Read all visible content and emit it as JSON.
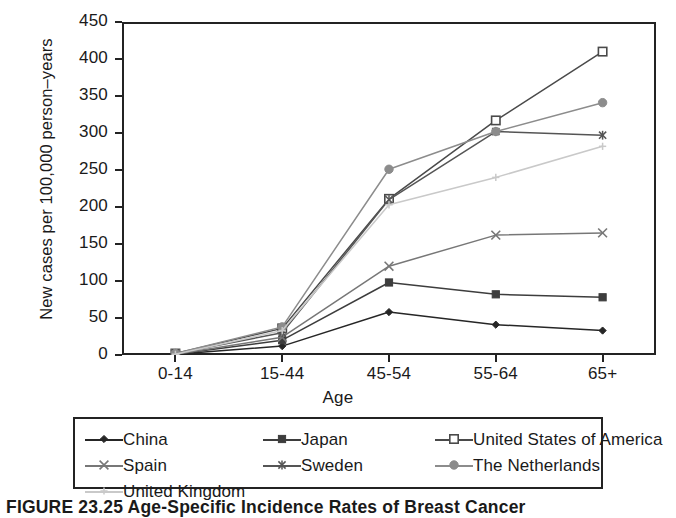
{
  "chart_data": {
    "type": "line",
    "title": "",
    "xlabel": "Age",
    "ylabel": "New cases per 100,000 person–years",
    "categories": [
      "0-14",
      "15-44",
      "45-54",
      "55-64",
      "65+"
    ],
    "ylim": [
      0,
      450
    ],
    "yticks": [
      0,
      50,
      100,
      150,
      200,
      250,
      300,
      350,
      400,
      450
    ],
    "grid": false,
    "legend_position": "bottom",
    "series": [
      {
        "name": "China",
        "values": [
          1,
          12,
          58,
          41,
          33
        ],
        "color": "#262626",
        "marker": "diamond"
      },
      {
        "name": "Japan",
        "values": [
          1,
          20,
          98,
          82,
          78
        ],
        "color": "#3d3d3d",
        "marker": "square-filled"
      },
      {
        "name": "United States of America",
        "values": [
          2,
          36,
          211,
          317,
          410
        ],
        "color": "#4a4a4a",
        "marker": "square-open"
      },
      {
        "name": "Spain",
        "values": [
          1,
          24,
          120,
          162,
          165
        ],
        "color": "#777777",
        "marker": "cross"
      },
      {
        "name": "Sweden",
        "values": [
          2,
          30,
          210,
          302,
          297
        ],
        "color": "#555555",
        "marker": "asterisk"
      },
      {
        "name": "The Netherlands",
        "values": [
          2,
          38,
          251,
          302,
          341
        ],
        "color": "#8c8c8c",
        "marker": "circle-filled"
      },
      {
        "name": "United Kingdom",
        "values": [
          1,
          33,
          203,
          240,
          282
        ],
        "color": "#c9c9c9",
        "marker": "plus"
      }
    ]
  },
  "axes": {
    "y_title": "New cases per 100,000 person–years",
    "x_title": "Age",
    "y_tick_labels": [
      "450",
      "400",
      "350",
      "300",
      "250",
      "200",
      "150",
      "100",
      "50",
      "0"
    ],
    "x_tick_labels": [
      "0-14",
      "15-44",
      "45-54",
      "55-64",
      "65+"
    ]
  },
  "legend": {
    "items": [
      {
        "label": "China"
      },
      {
        "label": "Japan"
      },
      {
        "label": "United States of America"
      },
      {
        "label": "Spain"
      },
      {
        "label": "Sweden"
      },
      {
        "label": "The Netherlands"
      },
      {
        "label": "United Kingdom"
      }
    ]
  },
  "caption": {
    "text": "FIGURE 23.25  Age-Specific Incidence Rates of Breast Cancer"
  }
}
